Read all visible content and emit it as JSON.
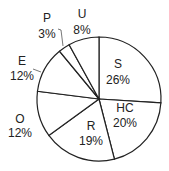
{
  "chart_data": {
    "type": "pie",
    "title": "",
    "categories": [
      "S",
      "HC",
      "R",
      "O",
      "E",
      "P",
      "U"
    ],
    "values": [
      26,
      20,
      19,
      12,
      12,
      3,
      8
    ],
    "labels": [
      "26%",
      "20%",
      "19%",
      "12%",
      "12%",
      "3%",
      "8%"
    ],
    "start_angle_deg": 0,
    "direction": "clockwise",
    "legend": "none",
    "colors": {
      "fill": "#ffffff",
      "stroke": "#222222"
    }
  },
  "slices": [
    {
      "name": "S",
      "pct": "26%",
      "lx": 118,
      "ly": 68,
      "px": 118,
      "py": 84
    },
    {
      "name": "HC",
      "pct": "20%",
      "lx": 125,
      "ly": 112,
      "px": 125,
      "py": 127
    },
    {
      "name": "R",
      "pct": "19%",
      "lx": 91,
      "ly": 130,
      "px": 91,
      "py": 145
    },
    {
      "name": "O",
      "pct": "12%",
      "lx": 20,
      "ly": 123,
      "px": 20,
      "py": 137
    },
    {
      "name": "E",
      "pct": "12%",
      "lx": 22,
      "ly": 65,
      "px": 22,
      "py": 80
    },
    {
      "name": "P",
      "pct": "3%",
      "lx": 47,
      "ly": 22,
      "px": 47,
      "py": 38
    },
    {
      "name": "U",
      "pct": "8%",
      "lx": 82,
      "ly": 18,
      "px": 82,
      "py": 34
    }
  ]
}
